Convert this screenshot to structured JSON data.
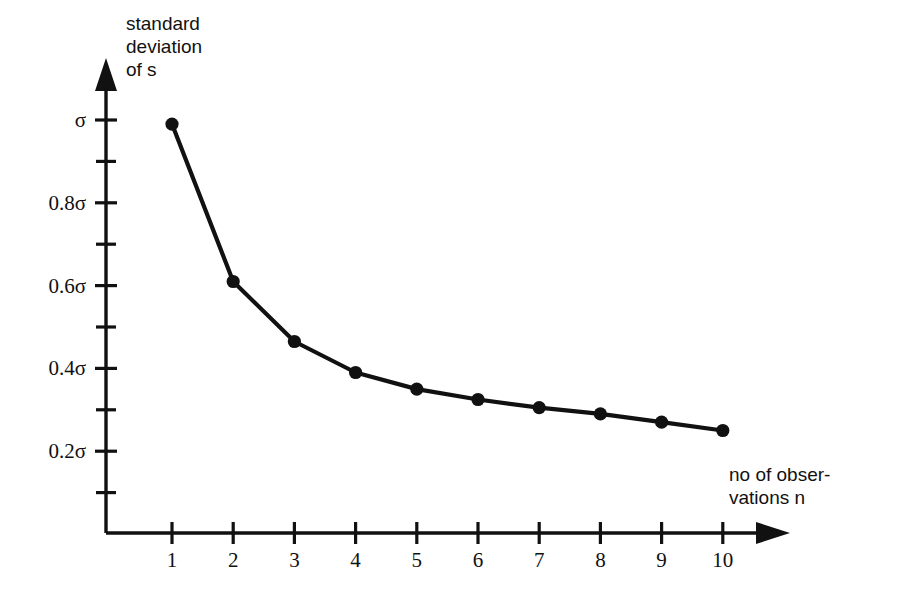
{
  "chart_data": {
    "type": "line",
    "title": "",
    "subtitle": "",
    "xlabel": "no of observations n",
    "ylabel": "standard deviation of s",
    "x": [
      1,
      2,
      3,
      4,
      5,
      6,
      7,
      8,
      9,
      10
    ],
    "values": [
      0.99,
      0.61,
      0.465,
      0.39,
      0.35,
      0.325,
      0.305,
      0.29,
      0.27,
      0.25
    ],
    "series": [
      {
        "name": "standard deviation of s",
        "values": [
          0.99,
          0.61,
          0.465,
          0.39,
          0.35,
          0.325,
          0.305,
          0.29,
          0.27,
          0.25
        ]
      }
    ],
    "categories": [
      "1",
      "2",
      "3",
      "4",
      "5",
      "6",
      "7",
      "8",
      "9",
      "10"
    ],
    "xlim": [
      0,
      11
    ],
    "ylim": [
      0,
      1.05
    ],
    "grid": false,
    "legend": false,
    "legend_position": "none",
    "y_unit": "sigma",
    "marker": "filled-circle",
    "line_color": "#111111",
    "marker_color": "#111111",
    "background_color": "#ffffff"
  },
  "axes": {
    "y": {
      "title_lines": [
        "standard",
        "deviation",
        "of s"
      ],
      "major_ticks": [
        {
          "value": 1.0,
          "label": "σ"
        },
        {
          "value": 0.8,
          "label": "0.8σ"
        },
        {
          "value": 0.6,
          "label": "0.6σ"
        },
        {
          "value": 0.4,
          "label": "0.4σ"
        },
        {
          "value": 0.2,
          "label": "0.2σ"
        }
      ],
      "minor_ticks": [
        {
          "value": 0.9,
          "label": ""
        },
        {
          "value": 0.7,
          "label": ""
        },
        {
          "value": 0.5,
          "label": ""
        },
        {
          "value": 0.3,
          "label": ""
        },
        {
          "value": 0.1,
          "label": ""
        }
      ],
      "arrow": true
    },
    "x": {
      "title_lines": [
        "no of obser-",
        "vations n"
      ],
      "ticks": [
        {
          "value": 1,
          "label": "1"
        },
        {
          "value": 2,
          "label": "2"
        },
        {
          "value": 3,
          "label": "3"
        },
        {
          "value": 4,
          "label": "4"
        },
        {
          "value": 5,
          "label": "5"
        },
        {
          "value": 6,
          "label": "6"
        },
        {
          "value": 7,
          "label": "7"
        },
        {
          "value": 8,
          "label": "8"
        },
        {
          "value": 9,
          "label": "9"
        },
        {
          "value": 10,
          "label": "10"
        }
      ],
      "arrow": true
    }
  },
  "colors": {
    "ink": "#111111",
    "background": "#ffffff"
  }
}
